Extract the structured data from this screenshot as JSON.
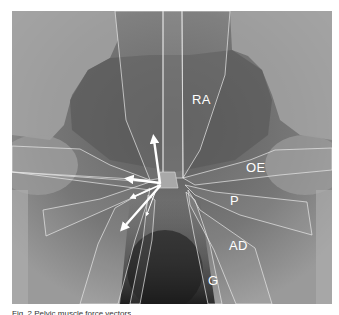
{
  "figure": {
    "type": "annotated-xray",
    "labels": [
      {
        "id": "RA",
        "text": "RA",
        "x": 192,
        "y": 98
      },
      {
        "id": "OE",
        "text": "OE",
        "x": 246,
        "y": 166
      },
      {
        "id": "P",
        "text": "P",
        "x": 229,
        "y": 199
      },
      {
        "id": "AD",
        "text": "AD",
        "x": 229,
        "y": 244
      },
      {
        "id": "G",
        "text": "G",
        "x": 208,
        "y": 278
      }
    ],
    "arrows": [
      {
        "name": "arrow-up",
        "from": [
          155,
          183
        ],
        "to": [
          150,
          132
        ]
      },
      {
        "name": "arrow-left-upper",
        "from": [
          155,
          183
        ],
        "to": [
          124,
          184
        ]
      },
      {
        "name": "arrow-left-mid",
        "from": [
          155,
          183
        ],
        "to": [
          128,
          199
        ]
      },
      {
        "name": "arrow-down-left",
        "from": [
          155,
          183
        ],
        "to": [
          117,
          234
        ]
      },
      {
        "name": "arrow-small-down",
        "from": [
          150,
          190
        ],
        "to": [
          141,
          219
        ]
      }
    ],
    "colors": {
      "overlay_line": "#e8e8e8",
      "arrow": "#ffffff",
      "hub": "#a9a9a9"
    }
  },
  "caption": {
    "text": "Fig. 2  Pelvic muscle force vectors"
  }
}
